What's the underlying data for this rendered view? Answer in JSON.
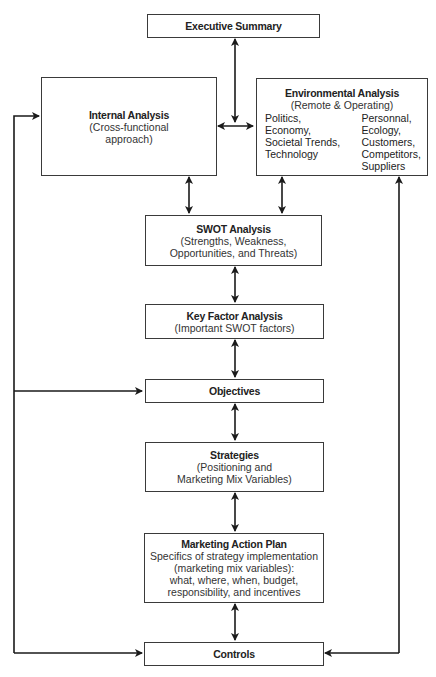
{
  "diagram": {
    "colors": {
      "line": "#1a1a1a",
      "border": "#3a3a3a",
      "background": "#ffffff"
    },
    "nodes": {
      "executive_summary": {
        "title": "Executive Summary"
      },
      "internal_analysis": {
        "title": "Internal Analysis",
        "lines": [
          "(Cross-functional",
          "approach)"
        ]
      },
      "environmental_analysis": {
        "title": "Environmental Analysis",
        "subtitle": "(Remote & Operating)",
        "left_column": [
          "Politics,",
          "Economy,",
          "Societal Trends,",
          "Technology"
        ],
        "right_column": [
          "Personnal,",
          "Ecology,",
          "Customers,",
          "Competitors,",
          "Suppliers"
        ]
      },
      "swot_analysis": {
        "title": "SWOT Analysis",
        "lines": [
          "(Strengths, Weakness,",
          "Opportunities, and Threats)"
        ]
      },
      "key_factor_analysis": {
        "title": "Key Factor Analysis",
        "lines": [
          "(Important SWOT factors)"
        ]
      },
      "objectives": {
        "title": "Objectives"
      },
      "strategies": {
        "title": "Strategies",
        "lines": [
          "(Positioning and",
          "Marketing Mix Variables)"
        ]
      },
      "marketing_action_plan": {
        "title": "Marketing Action Plan",
        "lines": [
          "Specifics of strategy implementation",
          "(marketing mix variables):",
          "what, where, when, budget,",
          "responsibility, and incentives"
        ]
      },
      "controls": {
        "title": "Controls"
      }
    },
    "edges": [
      {
        "from": "executive_summary",
        "to": "internal_analysis/environmental_analysis",
        "type": "bidirectional"
      },
      {
        "from": "internal_analysis",
        "to": "environmental_analysis",
        "type": "bidirectional"
      },
      {
        "from": "internal_analysis",
        "to": "swot_analysis",
        "type": "bidirectional"
      },
      {
        "from": "environmental_analysis",
        "to": "swot_analysis",
        "type": "bidirectional"
      },
      {
        "from": "swot_analysis",
        "to": "key_factor_analysis",
        "type": "bidirectional"
      },
      {
        "from": "key_factor_analysis",
        "to": "objectives",
        "type": "bidirectional"
      },
      {
        "from": "objectives",
        "to": "strategies",
        "type": "bidirectional"
      },
      {
        "from": "strategies",
        "to": "marketing_action_plan",
        "type": "bidirectional"
      },
      {
        "from": "marketing_action_plan",
        "to": "controls",
        "type": "bidirectional"
      },
      {
        "from": "left_feedback_loop",
        "to": "internal_analysis",
        "type": "directed"
      },
      {
        "from": "left_feedback_loop",
        "to": "objectives",
        "type": "directed"
      },
      {
        "from": "left_feedback_loop",
        "to": "controls",
        "type": "directed"
      },
      {
        "from": "right_feedback_loop",
        "to": "environmental_analysis",
        "type": "directed"
      },
      {
        "from": "right_feedback_loop",
        "to": "controls",
        "type": "directed"
      }
    ]
  }
}
